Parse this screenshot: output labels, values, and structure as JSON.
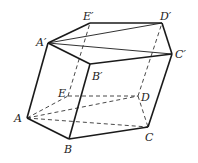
{
  "vertices": {
    "A": {
      "label": "A",
      "x": 27,
      "y": 118,
      "lx": 14,
      "ly": 122
    },
    "B": {
      "label": "B",
      "x": 69,
      "y": 139,
      "lx": 64,
      "ly": 153
    },
    "C": {
      "label": "C",
      "x": 148,
      "y": 127,
      "lx": 145,
      "ly": 141
    },
    "D": {
      "label": "D",
      "x": 138,
      "y": 96,
      "lx": 141,
      "ly": 101
    },
    "E": {
      "label": "E",
      "x": 68,
      "y": 96,
      "lx": 58,
      "ly": 97
    },
    "A1": {
      "label": "A′",
      "x": 48,
      "y": 43,
      "lx": 36,
      "ly": 46
    },
    "B1": {
      "label": "B′",
      "x": 90,
      "y": 64,
      "lx": 92,
      "ly": 80
    },
    "C1": {
      "label": "C′",
      "x": 172,
      "y": 54,
      "lx": 175,
      "ly": 58
    },
    "D1": {
      "label": "D′",
      "x": 162,
      "y": 23,
      "lx": 160,
      "ly": 20
    },
    "E1": {
      "label": "E′",
      "x": 90,
      "y": 23,
      "lx": 83,
      "ly": 20
    }
  },
  "solid_edges": [
    [
      "A",
      "B"
    ],
    [
      "B",
      "C"
    ],
    [
      "A",
      "A1"
    ],
    [
      "B",
      "B1"
    ],
    [
      "C",
      "C1"
    ],
    [
      "A1",
      "B1"
    ],
    [
      "B1",
      "C1"
    ],
    [
      "C1",
      "D1"
    ],
    [
      "D1",
      "E1"
    ],
    [
      "E1",
      "A1"
    ],
    [
      "A1",
      "D1"
    ],
    [
      "A1",
      "C1"
    ]
  ],
  "dashed_edges": [
    [
      "A",
      "E"
    ],
    [
      "E",
      "D"
    ],
    [
      "D",
      "C"
    ],
    [
      "E",
      "E1"
    ],
    [
      "D",
      "D1"
    ],
    [
      "A",
      "D"
    ],
    [
      "A",
      "C"
    ]
  ]
}
